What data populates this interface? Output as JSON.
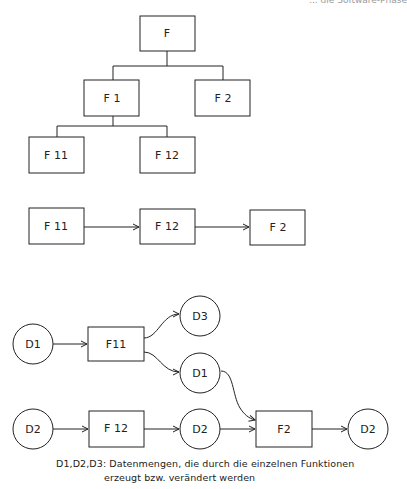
{
  "header": {
    "running_title": "... die Software-Phase"
  },
  "hierarchy": {
    "nodes": [
      {
        "id": "F",
        "label": "F"
      },
      {
        "id": "F1",
        "label": "F 1"
      },
      {
        "id": "F2",
        "label": "F 2"
      },
      {
        "id": "F11",
        "label": "F 11"
      },
      {
        "id": "F12",
        "label": "F 12"
      }
    ],
    "edges": [
      [
        "F",
        "F1"
      ],
      [
        "F",
        "F2"
      ],
      [
        "F1",
        "F11"
      ],
      [
        "F1",
        "F12"
      ]
    ]
  },
  "sequence": {
    "nodes": [
      {
        "id": "F11",
        "label": "F 11"
      },
      {
        "id": "F12",
        "label": "F 12"
      },
      {
        "id": "F2",
        "label": "F 2"
      }
    ],
    "edges": [
      [
        "F11",
        "F12"
      ],
      [
        "F12",
        "F2"
      ]
    ]
  },
  "dataflow": {
    "circles": [
      {
        "id": "d1_in",
        "label": "D1"
      },
      {
        "id": "d3",
        "label": "D3"
      },
      {
        "id": "d1_out",
        "label": "D1"
      },
      {
        "id": "d2_in",
        "label": "D2"
      },
      {
        "id": "d2_mid",
        "label": "D2"
      },
      {
        "id": "d2_out",
        "label": "D2"
      }
    ],
    "boxes": [
      {
        "id": "F11",
        "label": "F11"
      },
      {
        "id": "F12",
        "label": "F 12"
      },
      {
        "id": "F2",
        "label": "F2"
      }
    ],
    "edges": [
      [
        "d1_in",
        "F11"
      ],
      [
        "F11",
        "d3"
      ],
      [
        "F11",
        "d1_out"
      ],
      [
        "d1_out",
        "F2"
      ],
      [
        "d2_in",
        "F12"
      ],
      [
        "F12",
        "d2_mid"
      ],
      [
        "d2_mid",
        "F2"
      ],
      [
        "F2",
        "d2_out"
      ]
    ]
  },
  "caption": {
    "line1": "D1,D2,D3: Datenmengen, die durch die einzelnen Funktionen",
    "line2": "erzeugt bzw. verändert werden"
  }
}
